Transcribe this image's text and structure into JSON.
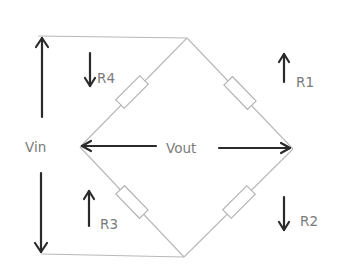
{
  "diagram": {
    "type": "wheatstone-bridge",
    "labels": {
      "vin": "Vin",
      "vout": "Vout",
      "r1": "R1",
      "r2": "R2",
      "r3": "R3",
      "r4": "R4"
    },
    "colors": {
      "wire": "#b8b8b8",
      "arrow": "#2a2a2a",
      "text": "#7a7a7a",
      "background": "#ffffff"
    },
    "nodes": {
      "top": [
        187,
        38
      ],
      "right": [
        293,
        149
      ],
      "bottom": [
        184,
        257
      ],
      "left": [
        80,
        147
      ]
    },
    "resistors": [
      {
        "name": "R1",
        "arm": "top-right",
        "center": [
          240,
          93
        ],
        "arrow": "up"
      },
      {
        "name": "R2",
        "arm": "bottom-right",
        "center": [
          239,
          202
        ],
        "arrow": "down"
      },
      {
        "name": "R3",
        "arm": "bottom-left",
        "center": [
          132,
          202
        ],
        "arrow": "up"
      },
      {
        "name": "R4",
        "arm": "top-left",
        "center": [
          132,
          92
        ],
        "arrow": "down"
      }
    ]
  }
}
